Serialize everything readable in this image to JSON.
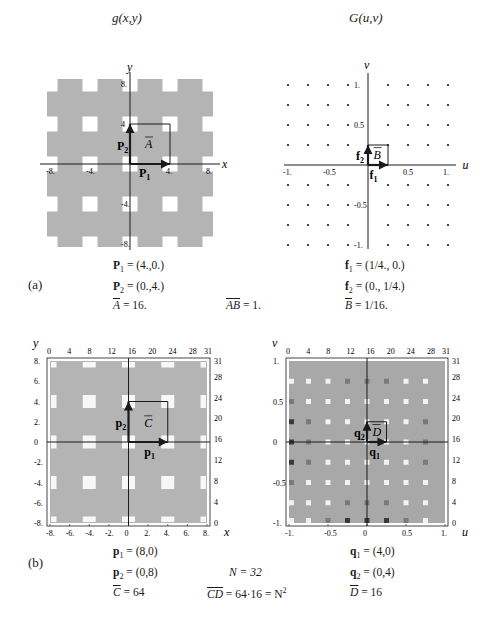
{
  "panel_a": {
    "label": "(a)",
    "left": {
      "title": "g(x,y)",
      "x_axis_label": "x",
      "y_axis_label": "y",
      "x_ticks": [
        "-8.",
        "-4.",
        "4.",
        "8."
      ],
      "x_tick_values": [
        -8,
        -4,
        4,
        8
      ],
      "y_ticks": [
        "8.",
        "4",
        "-4.",
        "-8."
      ],
      "y_tick_values": [
        8,
        4,
        -4,
        -8
      ],
      "vectors": [
        {
          "name": "P",
          "sub": "1",
          "to": [
            4,
            0
          ]
        },
        {
          "name": "P",
          "sub": "2",
          "to": [
            0,
            4
          ]
        }
      ],
      "cell_label": "A",
      "hole_centers_step": 4,
      "hole_size": 1.5,
      "range": [
        -8.3,
        8.3
      ]
    },
    "right": {
      "title": "G(u,v)",
      "x_axis_label": "u",
      "y_axis_label": "v",
      "x_ticks": [
        "-1.",
        "-0.5",
        "0.5",
        "1."
      ],
      "x_tick_values": [
        -1,
        -0.5,
        0.5,
        1
      ],
      "y_ticks": [
        "1.",
        "0.5",
        "-0.5",
        "-1."
      ],
      "y_tick_values": [
        1,
        0.5,
        -0.5,
        -1
      ],
      "dot_step": 0.25,
      "vectors": [
        {
          "name": "f",
          "sub": "1",
          "to": [
            0.25,
            0
          ]
        },
        {
          "name": "f",
          "sub": "2",
          "to": [
            0,
            0.25
          ]
        }
      ],
      "cell_label": "B"
    },
    "equations": {
      "P1": "= (4.,0.)",
      "P2": "= (0.,4.)",
      "A": "= 16.",
      "AB": "= 1.",
      "f1": "= (1/4., 0.)",
      "f2": "= (0., 1/4.)",
      "B": "= 1/16."
    }
  },
  "panel_b": {
    "label": "(b)",
    "left": {
      "x_axis_label": "x",
      "y_axis_label": "y",
      "bottom_ticks": [
        "-8.",
        "-6.",
        "-4.",
        "-2.",
        "0",
        "2.",
        "4.",
        "6.",
        "8."
      ],
      "bottom_tick_values": [
        -8,
        -6,
        -4,
        -2,
        0,
        2,
        4,
        6,
        8
      ],
      "left_ticks": [
        "8.",
        "6.",
        "4.",
        "2.",
        "0",
        "-2.",
        "-4.",
        "-6.",
        "-8."
      ],
      "left_tick_values": [
        8,
        6,
        4,
        2,
        0,
        -2,
        -4,
        -6,
        -8
      ],
      "top_ticks": [
        "0",
        "4",
        "8",
        "12",
        "16",
        "20",
        "24",
        "28",
        "31"
      ],
      "top_tick_values": [
        0,
        4,
        8,
        12,
        16,
        20,
        24,
        28,
        31
      ],
      "right_ticks": [
        "31",
        "28",
        "24",
        "20",
        "16",
        "12",
        "8",
        "4",
        "0"
      ],
      "right_tick_values": [
        31,
        28,
        24,
        20,
        16,
        12,
        8,
        4,
        0
      ],
      "vectors": [
        {
          "name": "p",
          "sub": "1",
          "to": [
            4,
            0
          ]
        },
        {
          "name": "p",
          "sub": "2",
          "to": [
            0,
            4
          ]
        }
      ],
      "cell_label": "C"
    },
    "right": {
      "x_axis_label": "u",
      "y_axis_label": "v",
      "bottom_ticks": [
        "-1.",
        "-0.5",
        "0",
        "0.5",
        "1."
      ],
      "bottom_tick_values": [
        -1,
        -0.5,
        0,
        0.5,
        1
      ],
      "left_ticks": [
        "1.",
        "0.5",
        "0",
        "-0.5",
        "-1."
      ],
      "left_tick_values": [
        1,
        0.5,
        0,
        -0.5,
        -1
      ],
      "top_ticks": [
        "0",
        "4",
        "8",
        "12",
        "16",
        "20",
        "24",
        "28",
        "31"
      ],
      "top_tick_values": [
        0,
        4,
        8,
        12,
        16,
        20,
        24,
        28,
        31
      ],
      "right_ticks": [
        "31",
        "28",
        "24",
        "20",
        "16",
        "12",
        "8",
        "4",
        "0"
      ],
      "right_tick_values": [
        31,
        28,
        24,
        20,
        16,
        12,
        8,
        4,
        0
      ],
      "vectors": [
        {
          "name": "q",
          "sub": "1",
          "to": [
            0.25,
            0
          ]
        },
        {
          "name": "q",
          "sub": "2",
          "to": [
            0,
            0.25
          ]
        }
      ],
      "cell_label": "D",
      "sample_rows_v": [
        0.75,
        0.5,
        0.25,
        0,
        -0.25,
        -0.5,
        -0.75,
        -1
      ],
      "sample_cols_u": [
        -1,
        -0.75,
        -0.5,
        -0.25,
        0,
        0.25,
        0.5,
        0.75
      ],
      "sample_shades": [
        [
          "L",
          "L",
          "L",
          "M",
          "M",
          "M",
          "L",
          "L"
        ],
        [
          "M",
          "L",
          "L",
          "L",
          "L",
          "L",
          "L",
          "L"
        ],
        [
          "D",
          "M",
          "L",
          "L",
          "L",
          "L",
          "L",
          "M"
        ],
        [
          "D",
          "M",
          "L",
          "L",
          "L",
          "L",
          "L",
          "M"
        ],
        [
          "D",
          "M",
          "L",
          "L",
          "L",
          "L",
          "L",
          "M"
        ],
        [
          "M",
          "L",
          "L",
          "L",
          "L",
          "L",
          "L",
          "L"
        ],
        [
          "L",
          "L",
          "L",
          "M",
          "M",
          "M",
          "L",
          "L"
        ],
        [
          "L",
          "L",
          "M",
          "D",
          "D",
          "D",
          "M",
          "L"
        ]
      ],
      "shade_colors": {
        "L": "#f2f2f2",
        "M": "#7a7a7a",
        "D": "#3a3a3a"
      }
    },
    "equations": {
      "p1": "= (8,0)",
      "p2": "= (0,8)",
      "C": "= 64",
      "N": "N = 32",
      "CD": "= 64·16 = N",
      "CD_exp": "2",
      "q1": "= (4,0)",
      "q2": "= (0,4)",
      "D": "= 16"
    }
  },
  "colors": {
    "gray_fill": "#b4b4b4",
    "axis": "#1a1a1a",
    "white": "#ffffff"
  }
}
